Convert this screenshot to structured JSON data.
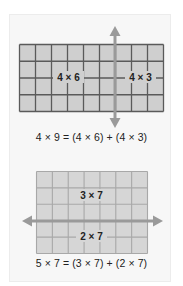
{
  "colors": {
    "panel_bg": "#f7f7f7",
    "cell_fill_1": "#cfcfcf",
    "grid_line_1": "#5a5a5a",
    "cell_fill_2": "#d6d6d6",
    "grid_line_2": "#a8a8a8",
    "arrow": "#9a9a9a",
    "text": "#222222"
  },
  "figure1": {
    "rows": 4,
    "cols": 9,
    "split_col": 6,
    "left_label": "4 × 6",
    "right_label": "4 × 3",
    "equation": "4 × 9 = (4 × 6) + (4 × 3)"
  },
  "figure2": {
    "rows": 5,
    "cols": 7,
    "split_row": 3,
    "top_label": "3 × 7",
    "bottom_label": "2 × 7",
    "equation": "5 × 7 = (3 × 7) + (2 × 7)"
  }
}
